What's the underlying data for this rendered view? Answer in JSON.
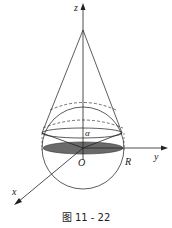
{
  "figure": {
    "caption": "图 11 - 22",
    "labels": {
      "z": "z",
      "y": "y",
      "x": "x",
      "origin": "O",
      "radius": "R",
      "angle": "α"
    }
  }
}
